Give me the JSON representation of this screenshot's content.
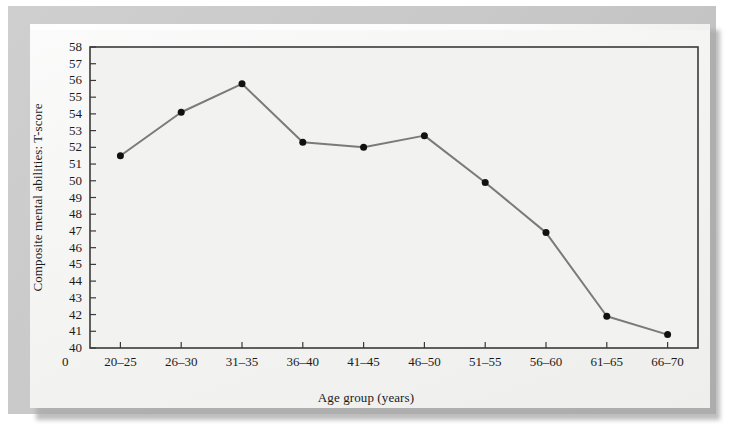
{
  "figure": {
    "background_color": "#c9c9c9",
    "plate_color": "#f4f4f2",
    "plot_background_color": "#f2f2f0",
    "frame_color": "#3a3a3a",
    "line_color": "#7a7a7a",
    "marker_color": "#111111",
    "text_color": "#1b1b1b",
    "origin_label": "0"
  },
  "chart_data": {
    "type": "line",
    "title": "",
    "xlabel": "Age group (years)",
    "ylabel": "Composite mental abilities: T-score",
    "categories": [
      "20–25",
      "26–30",
      "31–35",
      "36–40",
      "41–45",
      "46–50",
      "51–55",
      "56–60",
      "61–65",
      "66–70"
    ],
    "values": [
      51.5,
      54.1,
      55.8,
      52.3,
      52.0,
      52.7,
      49.9,
      46.9,
      41.9,
      40.8
    ],
    "ylim": [
      40,
      58
    ],
    "yticks": [
      40,
      41,
      42,
      43,
      44,
      45,
      46,
      47,
      48,
      49,
      50,
      51,
      52,
      53,
      54,
      55,
      56,
      57,
      58
    ],
    "ytick_labels": [
      "40",
      "41",
      "42",
      "43",
      "44",
      "45",
      "46",
      "47",
      "48",
      "49",
      "50",
      "51",
      "52",
      "53",
      "54",
      "55",
      "56",
      "57",
      "58"
    ],
    "grid": false,
    "legend": null,
    "legend_position": "none",
    "marker": "circle",
    "marker_size": 7,
    "line_width": 2
  }
}
